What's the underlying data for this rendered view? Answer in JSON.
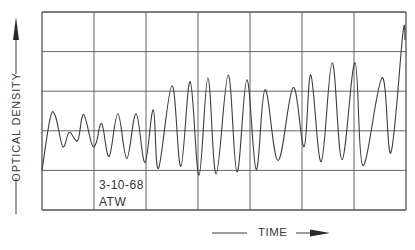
{
  "chart_data": {
    "type": "line",
    "title": "",
    "xlabel": "TIME",
    "ylabel": "OPTICAL DENSITY",
    "annotation": {
      "date": "3-10-68",
      "initials": "ATW"
    },
    "grid": true,
    "grid_divisions": {
      "x": 7,
      "y": 5
    },
    "xlim": [
      0,
      7
    ],
    "ylim": [
      0,
      5
    ],
    "tick_labels": {
      "x": [],
      "y": []
    },
    "legend": null,
    "series": [
      {
        "name": "optical density trace",
        "x": [
          0.0,
          0.16,
          0.26,
          0.4,
          0.52,
          0.63,
          0.7,
          0.8,
          0.96,
          1.04,
          1.15,
          1.29,
          1.46,
          1.63,
          1.81,
          1.98,
          2.14,
          2.24,
          2.5,
          2.67,
          2.85,
          3.02,
          3.19,
          3.35,
          3.58,
          3.75,
          3.94,
          4.12,
          4.29,
          4.54,
          4.83,
          5.04,
          5.17,
          5.37,
          5.58,
          5.77,
          6.02,
          6.17,
          6.54,
          6.71,
          6.94,
          6.98
        ],
        "y": [
          1.0,
          2.33,
          2.36,
          1.6,
          1.96,
          1.79,
          1.79,
          2.41,
          1.66,
          1.69,
          2.18,
          1.35,
          2.43,
          1.3,
          2.43,
          1.2,
          2.53,
          1.05,
          3.14,
          1.1,
          3.24,
          0.88,
          3.34,
          0.91,
          3.41,
          0.96,
          3.29,
          1.02,
          3.04,
          1.25,
          3.09,
          1.6,
          3.41,
          1.22,
          3.72,
          1.27,
          3.72,
          1.12,
          3.34,
          1.45,
          4.47,
          4.29
        ]
      }
    ]
  },
  "labels": {
    "y_axis": "OPTICAL DENSITY",
    "x_axis": "TIME",
    "date": "3-10-68",
    "initials": "ATW"
  },
  "colors": {
    "line": "#3c3c3c",
    "grid": "#555555",
    "text": "#333333"
  }
}
